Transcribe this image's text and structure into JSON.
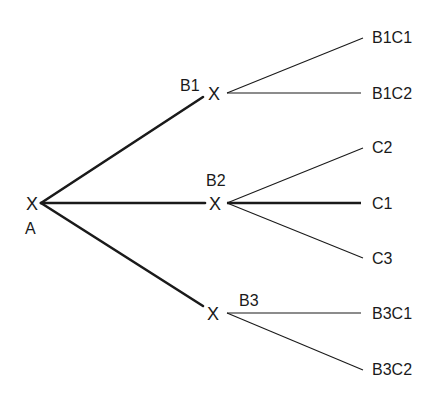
{
  "diagram": {
    "type": "tree",
    "colors": {
      "line": "#1a1a1a",
      "text": "#1a1a1a",
      "background": "#ffffff"
    },
    "root": {
      "marker": "X",
      "label": "A"
    },
    "branches": [
      {
        "marker": "X",
        "label": "B1",
        "children": [
          "B1C1",
          "B1C2"
        ]
      },
      {
        "marker": "X",
        "label": "B2",
        "children": [
          "C2",
          "C1",
          "C3"
        ]
      },
      {
        "marker": "X",
        "label": "B3",
        "children": [
          "B3C1",
          "B3C2"
        ]
      }
    ],
    "edges": [
      {
        "from": "A",
        "to": "B1",
        "weight": "thick"
      },
      {
        "from": "A",
        "to": "B2",
        "weight": "thick"
      },
      {
        "from": "A",
        "to": "B3",
        "weight": "thick"
      },
      {
        "from": "B1",
        "to": "B1C1",
        "weight": "thin"
      },
      {
        "from": "B1",
        "to": "B1C2",
        "weight": "thin"
      },
      {
        "from": "B2",
        "to": "C2",
        "weight": "thin"
      },
      {
        "from": "B2",
        "to": "C1",
        "weight": "thick"
      },
      {
        "from": "B2",
        "to": "C3",
        "weight": "thin"
      },
      {
        "from": "B3",
        "to": "B3C1",
        "weight": "thin"
      },
      {
        "from": "B3",
        "to": "B3C2",
        "weight": "thin"
      }
    ]
  }
}
